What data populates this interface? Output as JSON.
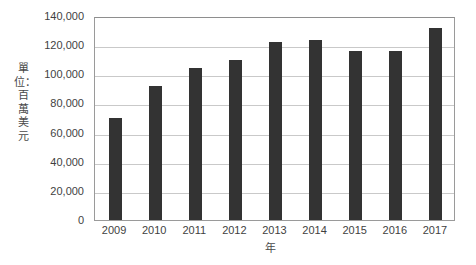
{
  "chart_data": {
    "type": "bar",
    "title": "",
    "subtitle": "",
    "xlabel": "年",
    "ylabel": "單位：百萬美元",
    "categories": [
      "2009",
      "2010",
      "2011",
      "2012",
      "2013",
      "2014",
      "2015",
      "2016",
      "2017"
    ],
    "values": [
      70000,
      92000,
      104000,
      110000,
      122000,
      123500,
      116000,
      116000,
      131500
    ],
    "series": [
      {
        "name": "",
        "values": [
          70000,
          92000,
          104000,
          110000,
          122000,
          123500,
          116000,
          116000,
          131500
        ]
      }
    ],
    "ylim": [
      0,
      140000
    ],
    "xlim": null,
    "yticks": [
      0,
      20000,
      40000,
      60000,
      80000,
      100000,
      120000,
      140000
    ],
    "ytick_labels": [
      "0",
      "20,000",
      "40,000",
      "60,000",
      "80,000",
      "100,000",
      "120,000",
      "140,000"
    ],
    "xtick_labels": [
      "2009",
      "2010",
      "2011",
      "2012",
      "2013",
      "2014",
      "2015",
      "2016",
      "2017"
    ],
    "grid": true,
    "grid_axis": "y",
    "legend": false,
    "legend_position": "none",
    "bar_color": "#333333",
    "grid_color": "#c9c9c9",
    "axis_color": "#9a9a9a",
    "background_color": "#ffffff",
    "text_color": "#3f3f3f",
    "annotations": []
  }
}
